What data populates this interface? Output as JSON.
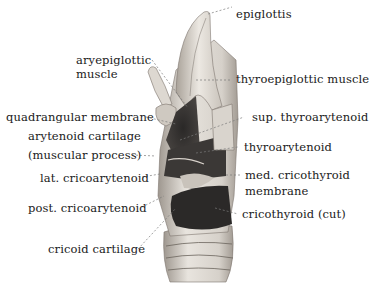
{
  "figure": {
    "labels": {
      "epiglottis": "epiglottis",
      "aryepiglottic_1": "aryepiglottic",
      "aryepiglottic_2": "muscle",
      "thyroepiglottic": "thyroepiglottic muscle",
      "quadrangular": "quadrangular membrane",
      "sup_thyroarytenoid": "sup. thyroarytenoid",
      "arytenoid_1": "arytenoid cartilage",
      "arytenoid_2": "(muscular process)",
      "thyroarytenoid": "thyroarytenoid",
      "lat_cricoarytenoid": "lat. cricoarytenoid",
      "med_cricothyroid_1": "med. cricothyroid",
      "med_cricothyroid_2": "membrane",
      "post_cricoarytenoid": "post. cricoarytenoid",
      "cricothyroid": "cricothyroid (cut)",
      "cricoid": "cricoid cartilage"
    },
    "colors": {
      "cartilage": "#e6e2dc",
      "cartilage_shade": "#b9b3ab",
      "muscle": "#3a3735",
      "muscle_dark": "#1e1c1b",
      "leader": "#777777"
    }
  }
}
